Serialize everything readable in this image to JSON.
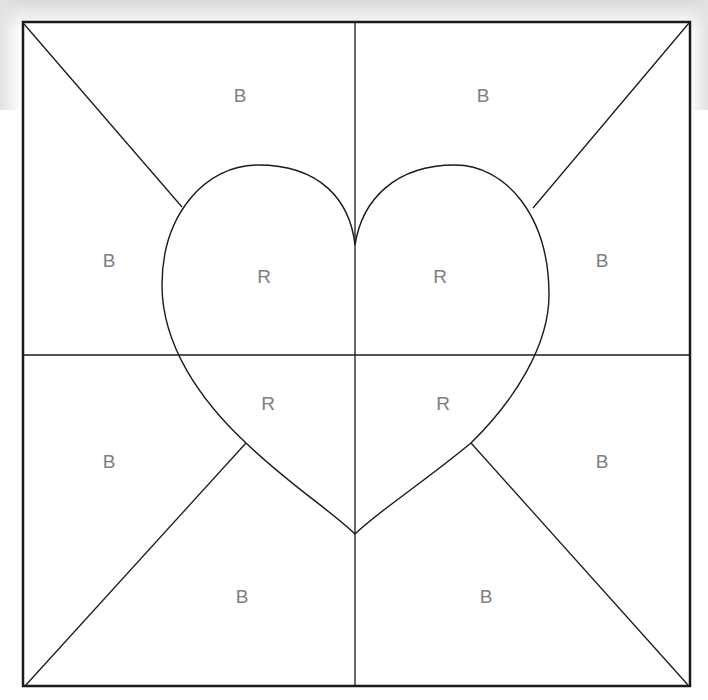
{
  "diagram": {
    "colors": {
      "line": "#1a1a1a",
      "label": "#808080",
      "background": "#ffffff"
    },
    "regions": [
      {
        "id": "top-left-top",
        "label": "B",
        "x": 240,
        "y": 95
      },
      {
        "id": "top-right-top",
        "label": "B",
        "x": 483,
        "y": 95
      },
      {
        "id": "top-left-side",
        "label": "B",
        "x": 109,
        "y": 260
      },
      {
        "id": "top-right-side",
        "label": "B",
        "x": 602,
        "y": 260
      },
      {
        "id": "heart-upper-left",
        "label": "R",
        "x": 264,
        "y": 276
      },
      {
        "id": "heart-upper-right",
        "label": "R",
        "x": 440,
        "y": 276
      },
      {
        "id": "heart-lower-left",
        "label": "R",
        "x": 268,
        "y": 403
      },
      {
        "id": "heart-lower-right",
        "label": "R",
        "x": 443,
        "y": 403
      },
      {
        "id": "bottom-left-side",
        "label": "B",
        "x": 109,
        "y": 461
      },
      {
        "id": "bottom-right-side",
        "label": "B",
        "x": 602,
        "y": 461
      },
      {
        "id": "bottom-left-bottom",
        "label": "B",
        "x": 242,
        "y": 596
      },
      {
        "id": "bottom-right-bottom",
        "label": "B",
        "x": 486,
        "y": 596
      }
    ]
  }
}
